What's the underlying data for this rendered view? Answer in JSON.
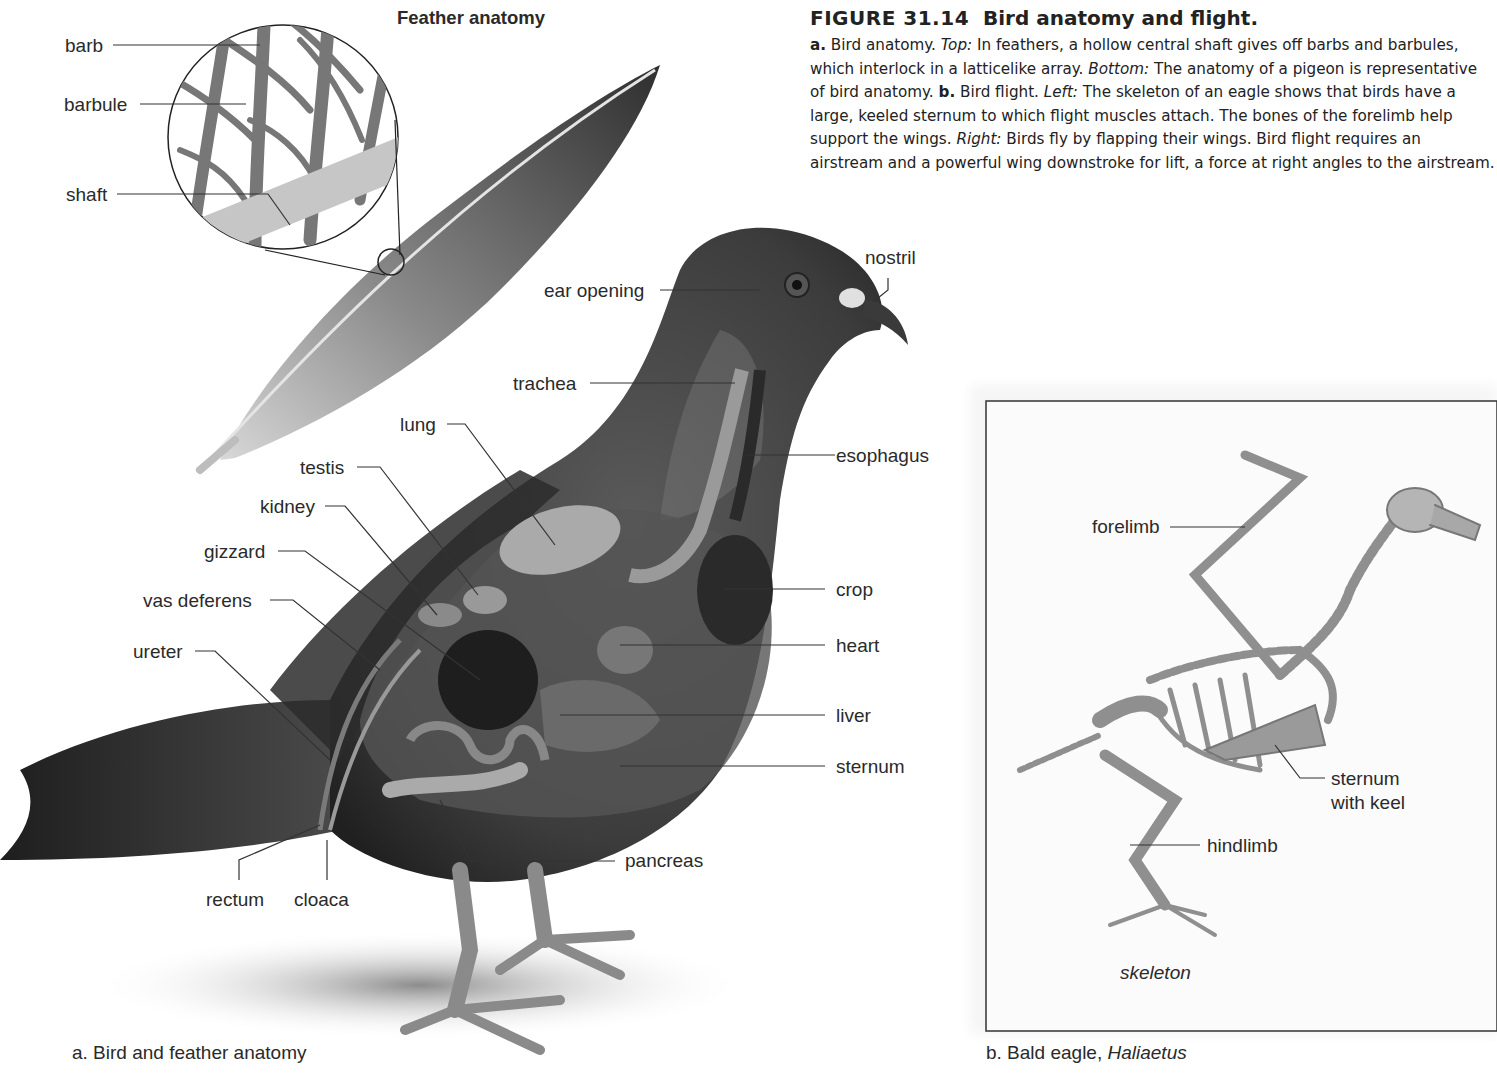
{
  "figure": {
    "number": "FIGURE 31.14",
    "title": "Bird anatomy and flight.",
    "caption": [
      {
        "t": "a.",
        "s": "b"
      },
      {
        "t": " Bird anatomy. ",
        "s": ""
      },
      {
        "t": "Top:",
        "s": "i"
      },
      {
        "t": " In feathers, a hollow central shaft gives off barbs and barbules, which interlock in a latticelike array. ",
        "s": ""
      },
      {
        "t": "Bottom:",
        "s": "i"
      },
      {
        "t": " The anatomy of a pigeon is representative of bird anatomy. ",
        "s": ""
      },
      {
        "t": "b.",
        "s": "b"
      },
      {
        "t": " Bird flight. ",
        "s": ""
      },
      {
        "t": "Left:",
        "s": "i"
      },
      {
        "t": " The skeleton of an eagle shows that birds have a large, keeled sternum to which flight muscles attach. The bones of the forelimb help support the wings. ",
        "s": ""
      },
      {
        "t": "Right:",
        "s": "i"
      },
      {
        "t": " Birds fly by flapping their wings. Bird flight requires an airstream and a powerful wing downstroke for lift, a force at right angles to the airstream.",
        "s": ""
      }
    ]
  },
  "panel_a": {
    "feather_title": "Feather anatomy",
    "feather_labels": {
      "barb": "barb",
      "barbule": "barbule",
      "shaft": "shaft"
    },
    "pigeon_labels": {
      "nostril": "nostril",
      "ear_opening": "ear opening",
      "trachea": "trachea",
      "lung": "lung",
      "esophagus": "esophagus",
      "testis": "testis",
      "kidney": "kidney",
      "gizzard": "gizzard",
      "vas_deferens": "vas deferens",
      "ureter": "ureter",
      "crop": "crop",
      "heart": "heart",
      "liver": "liver",
      "sternum": "sternum",
      "pancreas": "pancreas",
      "rectum": "rectum",
      "cloaca": "cloaca"
    },
    "subcaption": "a. Bird and feather anatomy"
  },
  "panel_b": {
    "labels": {
      "forelimb": "forelimb",
      "sternum_line1": "sternum",
      "sternum_line2": "with keel",
      "hindlimb": "hindlimb",
      "skeleton": "skeleton"
    },
    "subcaption_prefix": "b. Bald eagle, ",
    "subcaption_genus": "Haliaetus"
  }
}
